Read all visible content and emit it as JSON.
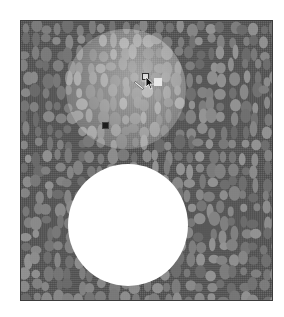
{
  "scene": {
    "background_color": "#5a5a5a",
    "pebble_color": "#8a8a8a",
    "frame": {
      "x": 20,
      "y": 20,
      "width": 253,
      "height": 281
    },
    "spotlight": {
      "cx": 125,
      "cy": 88,
      "r": 60
    },
    "hole": {
      "cx": 127,
      "cy": 223,
      "r": 60,
      "color": "#ffffff"
    },
    "markers": {
      "outlined_square": {
        "x": 141,
        "y": 72,
        "size": 7
      },
      "light_square": {
        "x": 153,
        "y": 77,
        "size": 8
      },
      "dark_square": {
        "x": 101,
        "y": 121,
        "size": 7
      },
      "cursor": {
        "x": 145,
        "y": 75
      }
    }
  }
}
